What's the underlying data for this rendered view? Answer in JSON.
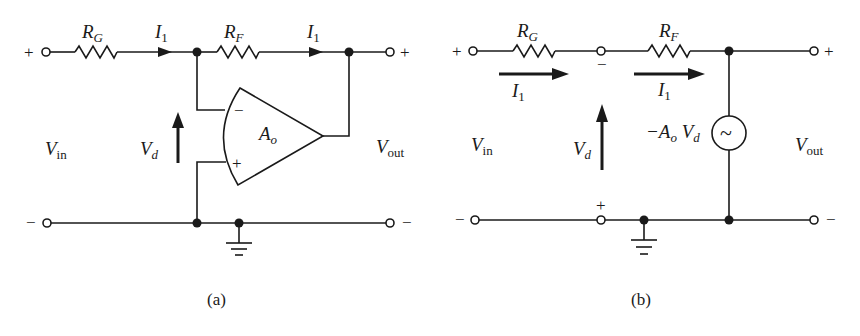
{
  "figure": {
    "panel_a": {
      "caption": "(a)",
      "resistor_g": {
        "main": "R",
        "sub": "G"
      },
      "resistor_f": {
        "main": "R",
        "sub": "F"
      },
      "current_1": {
        "main": "I",
        "sub": "1"
      },
      "current_2": {
        "main": "I",
        "sub": "1"
      },
      "vin": {
        "main": "V",
        "sub": "in"
      },
      "vout": {
        "main": "V",
        "sub": "out"
      },
      "vd": {
        "main": "V",
        "sub": "d"
      },
      "opamp_gain": {
        "main": "A",
        "sub": "o"
      },
      "opamp_minus": "−",
      "opamp_plus": "+",
      "terminal_in_plus": "+",
      "terminal_in_minus": "−",
      "terminal_out_plus": "+",
      "terminal_out_minus": "−"
    },
    "panel_b": {
      "caption": "(b)",
      "resistor_g": {
        "main": "R",
        "sub": "G"
      },
      "resistor_f": {
        "main": "R",
        "sub": "F"
      },
      "current_1": {
        "main": "I",
        "sub": "1"
      },
      "current_2": {
        "main": "I",
        "sub": "1"
      },
      "vin": {
        "main": "V",
        "sub": "in"
      },
      "vout": {
        "main": "V",
        "sub": "out"
      },
      "vd": {
        "main": "V",
        "sub": "d"
      },
      "source_label": {
        "prefix": "−A",
        "sub1": "o",
        "mid": " V",
        "sub2": "d"
      },
      "source_symbol": "~",
      "node_minus": "−",
      "node_plus": "+",
      "terminal_in_plus": "+",
      "terminal_in_minus": "−",
      "terminal_out_plus": "+",
      "terminal_out_minus": "−"
    }
  }
}
